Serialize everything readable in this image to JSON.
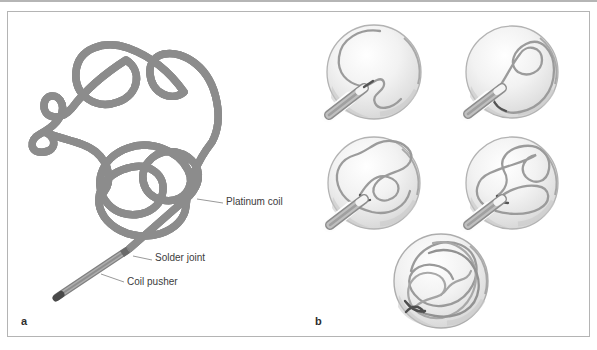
{
  "figure": {
    "panel_a": {
      "label": "a",
      "labels": {
        "platinum_coil": "Platinum coil",
        "solder_joint": "Solder joint",
        "coil_pusher": "Coil pusher"
      }
    },
    "panel_b": {
      "label": "b",
      "stages": [
        "stage-1",
        "stage-2",
        "stage-3",
        "stage-4",
        "stage-5"
      ]
    },
    "colors": {
      "frame_border": "#b4b4b4",
      "coil_outline": "#8c8c8c",
      "coil_body": "#c8c8c8",
      "coil_core": "#9a9a9a",
      "pusher_body": "#adadad",
      "solder_dark": "#6a6a6a",
      "sphere_edge": "#b3b3b3",
      "sphere_fill_edge": "#cfcfcf",
      "inner_coil": "#9b9b9b",
      "accent_dark": "#545454",
      "label_text": "#3c3c3c"
    }
  }
}
